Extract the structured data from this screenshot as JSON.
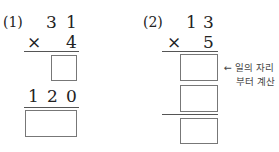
{
  "problems": [
    {
      "label": "(1)",
      "multiplicand_digits": [
        "3",
        "1"
      ],
      "times_sign": "×",
      "multiplier": "4",
      "partial_row_digits": [
        "1",
        "2",
        "0"
      ]
    },
    {
      "label": "(2)",
      "multiplicand_digits": [
        "1",
        "3"
      ],
      "times_sign": "×",
      "multiplier": "5",
      "note_arrow": "←",
      "note_lines": [
        "일의 자리",
        "부터 계산"
      ]
    }
  ]
}
